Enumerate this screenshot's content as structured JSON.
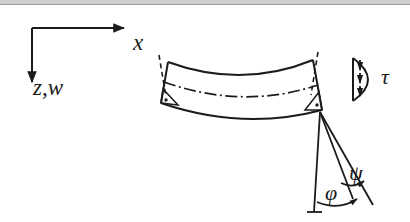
{
  "figure": {
    "background_color": "#ffffff",
    "ink_color": "#1b1b1b",
    "scan_edge_color": "#cfcfcf"
  },
  "axes": {
    "origin": {
      "x": 32,
      "y": 28
    },
    "x_axis": {
      "label": "x",
      "direction": "right",
      "arrow_tip": {
        "x": 128,
        "y": 28
      },
      "label_pos": {
        "x": 133,
        "y": 31
      }
    },
    "z_axis": {
      "label": "z,w",
      "direction": "down",
      "arrow_tip": {
        "x": 32,
        "y": 86
      },
      "label_pos": {
        "x": 33,
        "y": 76
      }
    }
  },
  "beam": {
    "name": "deformed-beam-element",
    "shape": "sagging curved beam with tilted end cross-sections",
    "top_edge": "M168,62 Q245,88 313,60",
    "bottom_edge": "M161,103 Q245,130 322,110",
    "centerline": "M164,82 Q245,108 318,85",
    "centerline_style": "dash-dot",
    "left_section": {
      "top": {
        "x": 168,
        "y": 62
      },
      "bottom": {
        "x": 161,
        "y": 103
      }
    },
    "right_section": {
      "top": {
        "x": 313,
        "y": 60
      },
      "bottom": {
        "x": 322,
        "y": 110
      }
    }
  },
  "normals": [
    {
      "name": "left-normal-dashed",
      "from": {
        "x": 159,
        "y": 55
      },
      "to": {
        "x": 166,
        "y": 96
      },
      "style": "dashed"
    },
    {
      "name": "right-normal-dashed",
      "from": {
        "x": 318,
        "y": 52
      },
      "to": {
        "x": 311,
        "y": 95
      },
      "style": "dashed"
    }
  ],
  "right_angle_markers": [
    {
      "name": "left-right-angle-marker",
      "vertex": {
        "x": 161,
        "y": 103
      }
    },
    {
      "name": "right-right-angle-marker",
      "vertex": {
        "x": 322,
        "y": 110
      }
    }
  ],
  "shear_distribution": {
    "name": "parabolic-shear-stress-profile",
    "label": "τ",
    "label_pos": {
      "x": 381,
      "y": 66
    },
    "profile_shape": "parabolic half-lobe",
    "axis_line": {
      "x": 353,
      "y_top": 58,
      "y_bottom": 101
    },
    "bulge_apex": {
      "x": 376,
      "y": 80
    },
    "arrow_count": 3,
    "arrow_direction": "down",
    "arrows": [
      {
        "x": 360,
        "y_start": 60,
        "y_end": 72
      },
      {
        "x": 360,
        "y_start": 73,
        "y_end": 85
      },
      {
        "x": 360,
        "y_start": 86,
        "y_end": 98
      }
    ]
  },
  "angles": {
    "apex": {
      "x": 320,
      "y": 112
    },
    "vertical_ref_line": {
      "from": {
        "x": 320,
        "y": 112
      },
      "to": {
        "x": 314,
        "y": 212
      }
    },
    "middle_line": {
      "from": {
        "x": 320,
        "y": 112
      },
      "to": {
        "x": 352,
        "y": 198
      }
    },
    "outer_line": {
      "from": {
        "x": 320,
        "y": 112
      },
      "to": {
        "x": 372,
        "y": 204
      }
    },
    "baseline_tick": {
      "from": {
        "x": 308,
        "y": 212
      },
      "to": {
        "x": 322,
        "y": 212
      }
    },
    "phi": {
      "label": "φ",
      "label_pos": {
        "x": 325,
        "y": 182
      },
      "description": "total cross-section rotation, between vertical reference and middle line",
      "arc": "M317,203 Q338,210 358,200",
      "arrow_at": {
        "x": 358,
        "y": 200
      }
    },
    "psi": {
      "label": "ψ",
      "label_pos": {
        "x": 349,
        "y": 162
      },
      "description": "shear rotation, between middle line and outer line",
      "arc": "M340,183 Q352,188 364,182",
      "arrow_at": {
        "x": 364,
        "y": 182
      }
    }
  },
  "legend_notes": {
    "symbols": [
      "x",
      "z,w",
      "τ",
      "φ",
      "ψ"
    ]
  }
}
